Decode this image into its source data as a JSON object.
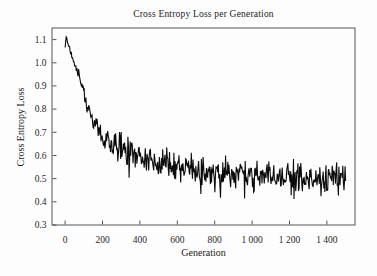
{
  "chart_data": {
    "type": "line",
    "title": "Cross Entropy Loss per Generation",
    "xlabel": "Generation",
    "ylabel": "Cross Entropy Loss",
    "xlim": [
      -70,
      1550
    ],
    "ylim": [
      0.3,
      1.15
    ],
    "grid": false,
    "legend": false,
    "x_ticks": [
      0,
      200,
      400,
      600,
      800,
      1000,
      1200,
      1400
    ],
    "x_tick_labels": [
      "0",
      "200",
      "400",
      "600",
      "800",
      "1 000",
      "1 200",
      "1 400"
    ],
    "y_ticks": [
      0.3,
      0.4,
      0.5,
      0.6,
      0.7,
      0.8,
      0.9,
      1.0,
      1.1
    ],
    "y_tick_labels": [
      "0.3",
      "0.4",
      "0.5",
      "0.6",
      "0.7",
      "0.8",
      "0.9",
      "1.0",
      "1.1"
    ],
    "line_color": "#0b0b0b",
    "axis_color": "#555555",
    "background": "#fdfdfd",
    "series": [
      {
        "name": "cross entropy loss",
        "x_range": [
          0,
          1500
        ],
        "sample_step": 3,
        "trend_points": [
          [
            0,
            1.07
          ],
          [
            8,
            1.115
          ],
          [
            14,
            1.09
          ],
          [
            20,
            1.075
          ],
          [
            28,
            1.05
          ],
          [
            36,
            1.03
          ],
          [
            45,
            1.01
          ],
          [
            55,
            0.985
          ],
          [
            62,
            0.97
          ],
          [
            70,
            0.955
          ],
          [
            80,
            0.93
          ],
          [
            90,
            0.9
          ],
          [
            100,
            0.865
          ],
          [
            110,
            0.835
          ],
          [
            120,
            0.805
          ],
          [
            132,
            0.785
          ],
          [
            145,
            0.755
          ],
          [
            160,
            0.725
          ],
          [
            175,
            0.705
          ],
          [
            190,
            0.69
          ],
          [
            210,
            0.672
          ],
          [
            230,
            0.658
          ],
          [
            255,
            0.645
          ],
          [
            280,
            0.635
          ],
          [
            310,
            0.622
          ],
          [
            340,
            0.61
          ],
          [
            370,
            0.6
          ],
          [
            400,
            0.592
          ],
          [
            440,
            0.582
          ],
          [
            480,
            0.572
          ],
          [
            520,
            0.565
          ],
          [
            560,
            0.558
          ],
          [
            600,
            0.552
          ],
          [
            650,
            0.545
          ],
          [
            700,
            0.539
          ],
          [
            750,
            0.533
          ],
          [
            800,
            0.528
          ],
          [
            850,
            0.523
          ],
          [
            900,
            0.519
          ],
          [
            950,
            0.515
          ],
          [
            1000,
            0.512
          ],
          [
            1060,
            0.508
          ],
          [
            1120,
            0.505
          ],
          [
            1180,
            0.502
          ],
          [
            1240,
            0.5
          ],
          [
            1300,
            0.499
          ],
          [
            1360,
            0.498
          ],
          [
            1420,
            0.497
          ],
          [
            1500,
            0.497
          ]
        ],
        "noise": {
          "amp_start": 0.015,
          "amp_end": 0.08,
          "ramp_start_gen": 40,
          "ramp_end_gen": 250,
          "spike_multiplier": 1.9,
          "spike_probability": 0.07,
          "seed": 1337
        }
      }
    ]
  }
}
